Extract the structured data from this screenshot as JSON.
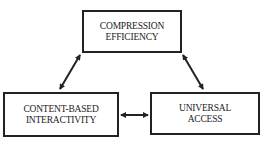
{
  "diagram": {
    "nodes": [
      {
        "id": "top",
        "lines": [
          "COMPRESSION",
          "EFFICIENCY"
        ]
      },
      {
        "id": "left",
        "lines": [
          "CONTENT-BASED",
          "INTERACTIVITY"
        ]
      },
      {
        "id": "right",
        "lines": [
          "UNIVERSAL",
          "ACCESS"
        ]
      }
    ],
    "edges": [
      {
        "from": "top",
        "to": "left",
        "type": "bidirectional-arrow"
      },
      {
        "from": "top",
        "to": "right",
        "type": "bidirectional-arrow"
      },
      {
        "from": "left",
        "to": "right",
        "type": "bidirectional-arrow"
      }
    ],
    "colors": {
      "stroke": "#222222",
      "background": "#ffffff"
    }
  }
}
